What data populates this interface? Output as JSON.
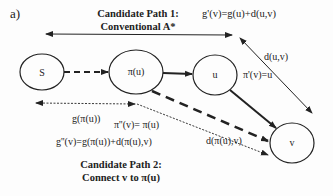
{
  "figure_label": "a)",
  "path1": {
    "title_line1": "Candidate Path 1:",
    "title_line2": "Conventional A*",
    "cost_formula": "g'(v)=g(u)+d(u,v)",
    "parent_assignment": "π'(v)=u",
    "edge_label": "d(u,v)"
  },
  "path2": {
    "title_line1": "Candidate Path 2:",
    "title_line2": "Connect v to π(u)",
    "cost_formula": "g''(v)=g(π(u))+d(π(u),v)",
    "parent_assignment": "π''(v)= π(u)",
    "edge_label": "d(π(u),v)",
    "prefix_cost_label": "g(π(u))"
  },
  "nodes": {
    "s": "S",
    "parent_u": "π(u)",
    "u": "u",
    "v": "v"
  },
  "colors": {
    "stroke": "#222222",
    "background": "#fdfdfd"
  }
}
